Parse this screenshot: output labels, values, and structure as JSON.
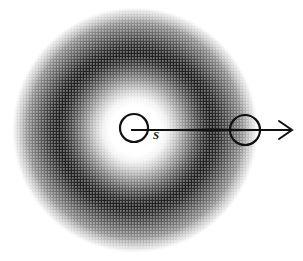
{
  "figure": {
    "title": "",
    "type": "physics-schematic",
    "canvas": {
      "width": 303,
      "height": 261,
      "background": "#ffffff"
    }
  },
  "halo": {
    "name": "radial-shaded-blob",
    "center": {
      "x": 135,
      "y": 130
    },
    "outer_radius": 123,
    "core_radius": 32,
    "dark_ring_radius": 72,
    "stops": [
      {
        "offset": "0%",
        "color": "#ffffff"
      },
      {
        "offset": "20%",
        "color": "#ffffff"
      },
      {
        "offset": "26%",
        "color": "#f2f2f2"
      },
      {
        "offset": "33%",
        "color": "#c8c8c8"
      },
      {
        "offset": "41%",
        "color": "#8f8f8f"
      },
      {
        "offset": "49%",
        "color": "#5a5a5a"
      },
      {
        "offset": "56%",
        "color": "#333333"
      },
      {
        "offset": "62%",
        "color": "#1f1f1f"
      },
      {
        "offset": "68%",
        "color": "#2e2e2e"
      },
      {
        "offset": "76%",
        "color": "#555555"
      },
      {
        "offset": "85%",
        "color": "#848484"
      },
      {
        "offset": "93%",
        "color": "#b4b4b4"
      },
      {
        "offset": "100%",
        "color": "#e8e8e8"
      }
    ]
  },
  "source_marker": {
    "name": "source-circle",
    "label": "S",
    "center": {
      "x": 134,
      "y": 128
    },
    "radius": 14,
    "stroke": "#111111",
    "stroke_width": 2.2,
    "label_position": {
      "x": 153,
      "y": 139
    }
  },
  "shell_marker": {
    "name": "shell-circle",
    "label": "",
    "center": {
      "x": 245,
      "y": 130
    },
    "radius": 15,
    "stroke": "#111111",
    "stroke_width": 2.2
  },
  "arrow": {
    "name": "radial-direction-arrow",
    "start": {
      "x": 131,
      "y": 130
    },
    "end": {
      "x": 292,
      "y": 130
    },
    "stroke": "#111111",
    "stroke_width": 2,
    "head_length": 13,
    "head_half_width": 9
  },
  "halftone": {
    "name": "halftone-dither-overlay",
    "dot_spacing": 3,
    "dot_radius": 0.85,
    "opacity": 0.5,
    "color": "#ffffff"
  }
}
